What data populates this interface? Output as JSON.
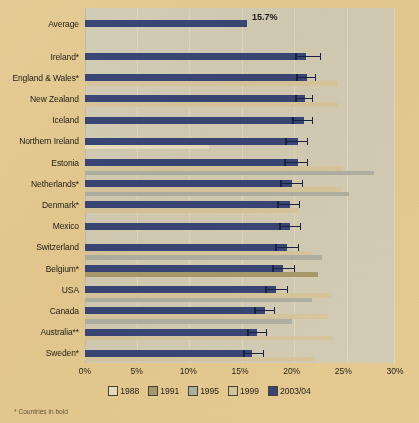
{
  "chart_data": {
    "type": "bar",
    "orientation": "horizontal",
    "title": "",
    "xlabel": "",
    "ylabel": "",
    "xlim": [
      0,
      30
    ],
    "xticks": [
      "0%",
      "5%",
      "10%",
      "15%",
      "20%",
      "25%",
      "30%"
    ],
    "xtick_values": [
      0,
      5,
      10,
      15,
      20,
      25,
      30
    ],
    "grid": true,
    "legend_position": "bottom",
    "legend": [
      {
        "name": "1988",
        "color": "#f7f8fa"
      },
      {
        "name": "1991",
        "color": "#b3ad8e"
      },
      {
        "name": "1995",
        "color": "#b9c6d8"
      },
      {
        "name": "1999",
        "color": "#e4ded0"
      },
      {
        "name": "2003/04",
        "color": "#3c4f9c"
      }
    ],
    "average_row": {
      "label": "Average",
      "value": 15.7,
      "value_label": "15.7%",
      "series": "2003/04"
    },
    "categories": [
      "Ireland*",
      "England & Wales*",
      "New Zealand",
      "Iceland",
      "Northern Ireland",
      "Estonia",
      "Netherlands*",
      "Denmark*",
      "Mexico",
      "Switzerland",
      "Belgium*",
      "USA",
      "Canada",
      "Australia**",
      "Sweden*"
    ],
    "series": [
      {
        "name": "2003/04",
        "color": "#3c4f9c",
        "values": [
          21.4,
          21.5,
          21.3,
          21.2,
          20.6,
          20.6,
          20.0,
          19.8,
          19.8,
          19.5,
          19.2,
          18.5,
          17.4,
          16.6,
          16.2
        ],
        "error_low": [
          20.3,
          20.4,
          20.3,
          20.0,
          19.4,
          19.3,
          18.9,
          18.6,
          18.8,
          18.4,
          18.1,
          17.4,
          16.4,
          15.7,
          15.3
        ],
        "error_high": [
          22.8,
          22.4,
          22.1,
          22.1,
          21.6,
          21.6,
          21.1,
          20.8,
          20.9,
          20.7,
          20.3,
          19.6,
          18.4,
          17.6,
          17.3
        ]
      },
      {
        "name": "1999",
        "color": "#e4ded0",
        "values": [
          null,
          24.5,
          24.5,
          null,
          null,
          25.0,
          24.8,
          20.6,
          null,
          22.0,
          null,
          23.8,
          23.5,
          24.0,
          22.3
        ]
      },
      {
        "name": "1995",
        "color": "#b9c6d8",
        "values": [
          null,
          null,
          null,
          null,
          null,
          28.0,
          25.5,
          null,
          null,
          22.9,
          null,
          22.0,
          20.0,
          null,
          null
        ]
      },
      {
        "name": "1991",
        "color": "#b3ad8e",
        "values": [
          null,
          null,
          null,
          null,
          null,
          null,
          null,
          null,
          null,
          null,
          22.5,
          null,
          null,
          null,
          null
        ]
      },
      {
        "name": "1988",
        "color": "#f7f8fa",
        "values": [
          null,
          null,
          null,
          null,
          12.0,
          null,
          null,
          null,
          null,
          null,
          null,
          null,
          null,
          null,
          null
        ]
      }
    ]
  },
  "axis": {
    "ticks": [
      "0%",
      "5%",
      "10%",
      "15%",
      "20%",
      "25%",
      "30%"
    ]
  },
  "legend": {
    "items": [
      {
        "label": "1988"
      },
      {
        "label": "1991"
      },
      {
        "label": "1995"
      },
      {
        "label": "1999"
      },
      {
        "label": "2003/04"
      }
    ]
  },
  "rows": [
    {
      "label": "Average"
    },
    {
      "label": "Ireland*"
    },
    {
      "label": "England & Wales*"
    },
    {
      "label": "New Zealand"
    },
    {
      "label": "Iceland"
    },
    {
      "label": "Northern Ireland"
    },
    {
      "label": "Estonia"
    },
    {
      "label": "Netherlands*"
    },
    {
      "label": "Denmark*"
    },
    {
      "label": "Mexico"
    },
    {
      "label": "Switzerland"
    },
    {
      "label": "Belgium*"
    },
    {
      "label": "USA"
    },
    {
      "label": "Canada"
    },
    {
      "label": "Australia**"
    },
    {
      "label": "Sweden*"
    }
  ],
  "value_label": "15.7%",
  "footnote": "* Countries in bold"
}
